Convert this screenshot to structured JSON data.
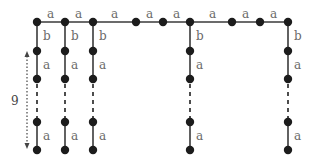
{
  "diagram": {
    "type": "graph",
    "colors": {
      "node": "#1c1c1c",
      "edge": "#3a3a3a",
      "label": "#6a6a6a"
    },
    "spine": {
      "y": 22,
      "nodes_x": [
        37,
        65,
        93,
        136,
        163,
        190,
        232,
        260,
        288
      ],
      "edge_labels": [
        "a",
        "a",
        "a",
        "a",
        "a",
        "a",
        "a",
        "a"
      ]
    },
    "teeth": [
      {
        "x": 37,
        "edges": [
          "b",
          "a",
          "…",
          "a"
        ]
      },
      {
        "x": 65,
        "edges": [
          "b",
          "a",
          "…",
          "a"
        ]
      },
      {
        "x": 93,
        "edges": [
          "b",
          "a",
          "…",
          "a"
        ]
      },
      {
        "x": 190,
        "edges": [
          "b",
          "a",
          "…",
          "a"
        ]
      },
      {
        "x": 288,
        "edges": [
          "b",
          "a",
          "…",
          "a"
        ]
      }
    ],
    "rows_y": [
      22,
      51,
      79,
      122,
      150
    ],
    "length_indicator": {
      "label": "9",
      "x": 27,
      "y_top": 51,
      "y_bottom": 150
    },
    "labels": {
      "a": "a",
      "b": "b",
      "count": "9"
    }
  }
}
